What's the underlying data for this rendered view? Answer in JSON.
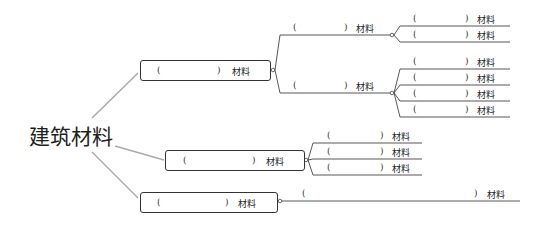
{
  "root": {
    "label": "建筑材料"
  },
  "suffix": "材料",
  "open": "(",
  "close": ")",
  "branches": [
    {
      "label": "(          ) 材料",
      "children": [
        {
          "label": "(          ) 材料",
          "children": [
            {
              "label": "(          ) 材料"
            },
            {
              "label": "(          ) 材料"
            }
          ]
        },
        {
          "label": "(          ) 材料",
          "children": [
            {
              "label": "(          ) 材料"
            },
            {
              "label": "(          ) 材料"
            },
            {
              "label": "(          ) 材料"
            },
            {
              "label": "(          ) 材料"
            }
          ]
        }
      ]
    },
    {
      "label": "(          ) 材料",
      "children": [
        {
          "label": "(          ) 材料"
        },
        {
          "label": "(          ) 材料"
        },
        {
          "label": "(          ) 材料"
        }
      ]
    },
    {
      "label": "(          ) 材料",
      "children": [
        {
          "label": "(                              ) 材料"
        }
      ]
    }
  ]
}
